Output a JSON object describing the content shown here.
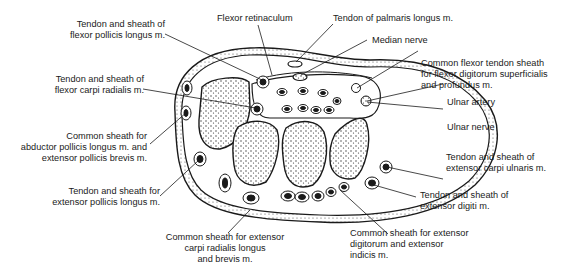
{
  "figure": {
    "colors": {
      "ink": "#1a1a1a",
      "background": "#ffffff",
      "bone_fill": "#ffffff",
      "stipple": "#333333"
    }
  },
  "labels": {
    "fpl": "Tendon and sheath of\nflexor pollicis longus m.",
    "fcr": "Tendon and sheath of\nflexor carpi radialis m.",
    "apl_epb": "Common sheath for\nabductor pollicis longus m. and\nextensor pollicis brevis m.",
    "epl": "Tendon and sheath for\nextensor pollicis longus m.",
    "ecrl_ecrb": "Common sheath for extensor\ncarpi radialis longus\nand brevis m.",
    "flexor_retinaculum": "Flexor retinaculum",
    "palmaris_longus": "Tendon of palmaris longus m.",
    "median_nerve": "Median nerve",
    "common_flexor": "Common flexor tendon sheath\nfor flexor digitorum superficialis\nand profundus m.",
    "ulnar_artery": "Ulnar artery",
    "ulnar_nerve": "Ulnar nerve",
    "ecu": "Tendon and sheath of\nextensor carpi ulnaris m.",
    "edm": "Tendon and sheath of\nextensor digiti m.",
    "ed_ei": "Common sheath for extensor\ndigitorum and extensor\nindicis m."
  }
}
